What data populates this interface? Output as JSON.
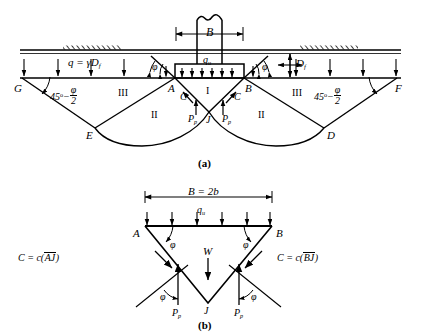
{
  "figure": {
    "captions": {
      "a": "(a)",
      "b": "(b)"
    },
    "colors": {
      "line": "#000000",
      "background": "#ffffff"
    }
  },
  "panel_a": {
    "width_dim": "B",
    "bearing_pressure": "q",
    "bearing_pressure_sub": "u",
    "surcharge_label": "q = γD",
    "surcharge_sub": "f",
    "depth_label": "D",
    "depth_sub": "f",
    "wedge_angle_left": "φ",
    "wedge_angle_right": "φ",
    "rankine_angle_num": "45",
    "rankine_angle_deg": "o",
    "rankine_angle_minus": "−",
    "rankine_angle_frac_num": "φ",
    "rankine_angle_frac_den": "2",
    "zone_I": "I",
    "zone_II_left": "II",
    "zone_II_right": "II",
    "zone_III_left": "III",
    "zone_III_right": "III",
    "points": {
      "G": "G",
      "A": "A",
      "B": "B",
      "F": "F",
      "E": "E",
      "D": "D",
      "J": "J"
    },
    "cohesion_left": "C",
    "cohesion_right": "C",
    "passive_left": "P",
    "passive_left_sub": "p",
    "passive_right": "P",
    "passive_right_sub": "p"
  },
  "panel_b": {
    "width_dim": "B = 2b",
    "bearing_pressure": "q",
    "bearing_pressure_sub": "u",
    "weight": "W",
    "angle_left": "φ",
    "angle_right": "φ",
    "angle_lower_left": "φ",
    "angle_lower_right": "φ",
    "cohesion_left_prefix": "C = c(",
    "cohesion_left_bar": "AJ",
    "cohesion_left_suffix": ")",
    "cohesion_right_prefix": "C = c(",
    "cohesion_right_bar": "BJ",
    "cohesion_right_suffix": ")",
    "passive_left": "P",
    "passive_left_sub": "p",
    "passive_right": "P",
    "passive_right_sub": "p",
    "points": {
      "A": "A",
      "B": "B",
      "J": "J"
    }
  }
}
